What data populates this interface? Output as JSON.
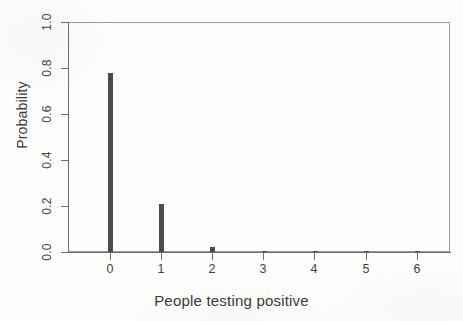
{
  "chart_data": {
    "type": "bar",
    "title": "",
    "subtitle": "",
    "xlabel": "People testing positive",
    "ylabel": "Probability",
    "categories": [
      "0",
      "1",
      "2",
      "3",
      "4",
      "5",
      "6"
    ],
    "values": [
      0.78,
      0.21,
      0.022,
      0.001,
      0.0005,
      0.0002,
      0.0001
    ],
    "xlim": [
      -0.82,
      6.67
    ],
    "ylim": [
      0.0,
      1.0
    ],
    "xticks": [
      "0",
      "1",
      "2",
      "3",
      "4",
      "5",
      "6"
    ],
    "yticks": [
      "0.0",
      "0.2",
      "0.4",
      "0.6",
      "0.8",
      "1.0"
    ],
    "ytick_values": [
      0.0,
      0.2,
      0.4,
      0.6,
      0.8,
      1.0
    ],
    "grid": false,
    "legend": null,
    "annotations": [],
    "style": "r-base-graphics-spike-plot",
    "bar_color": "#4c4c4c",
    "axis_color": "#6d6d6d",
    "text_color": "#3a3a3a",
    "background_color": "#fdfdfc"
  }
}
